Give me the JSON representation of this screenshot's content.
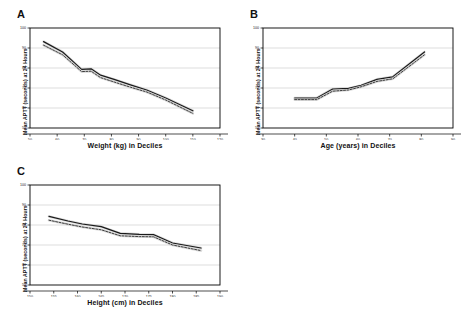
{
  "figure": {
    "background": "#ffffff",
    "axis_color": "#000000",
    "grid_color": "#b8b8b8",
    "solid_series_color": "#1a1a1a",
    "dashed_series_color": "#2b2b2b",
    "halo_color": "#cfcfcf"
  },
  "panels": [
    {
      "letter": "A",
      "ylabel": "Mean APTT (seconds) at 24 Hours",
      "xlabel": "Weight (kg) in Deciles"
    },
    {
      "letter": "B",
      "ylabel": "Mean APTT (seconds) at 24 Hours",
      "xlabel": "Age (years) in Deciles"
    },
    {
      "letter": "C",
      "ylabel": "Mean APTT (seconds) at 24 Hours",
      "xlabel": "Height (cm) in Deciles"
    }
  ],
  "chart_data": [
    {
      "type": "line",
      "panel": "A",
      "title": "",
      "xlabel": "Weight (kg) in Deciles",
      "ylabel": "Mean APTT (seconds) at 24 Hours",
      "xlim": [
        50,
        120
      ],
      "ylim": [
        50,
        100
      ],
      "xticks": [
        50,
        60,
        70,
        80,
        90,
        100,
        110,
        120
      ],
      "yticks": [
        50,
        60,
        70,
        80,
        90,
        100
      ],
      "grid": true,
      "legend": "none",
      "series": [
        {
          "name": "Observed mean APTT",
          "style": "solid",
          "x": [
            55,
            62,
            69,
            72.5,
            76,
            81,
            87,
            93,
            100,
            110
          ],
          "values": [
            93.2,
            88.0,
            79.3,
            79.6,
            76.4,
            74.3,
            71.6,
            69.0,
            65.0,
            58.6
          ]
        },
        {
          "name": "Predicted mean APTT",
          "style": "dashed",
          "x": [
            55,
            62,
            69,
            72.5,
            76,
            81,
            87,
            93,
            100,
            110
          ],
          "values": [
            91.4,
            86.6,
            78.2,
            78.4,
            75.2,
            73.0,
            70.4,
            68.0,
            64.0,
            57.3
          ]
        }
      ]
    },
    {
      "type": "line",
      "panel": "B",
      "title": "",
      "xlabel": "Age (years) in Deciles",
      "ylabel": "Mean APTT (seconds) at 24 Hours",
      "xlim": [
        30,
        90
      ],
      "ylim": [
        50,
        100
      ],
      "xticks": [
        30,
        40,
        50,
        60,
        70,
        80,
        90
      ],
      "yticks": [
        50,
        60,
        70,
        80,
        90,
        100
      ],
      "grid": true,
      "legend": "none",
      "series": [
        {
          "name": "Observed mean APTT",
          "style": "solid",
          "x": [
            40,
            47,
            52,
            57,
            61,
            66,
            71,
            81
          ],
          "values": [
            65.0,
            65.0,
            69.5,
            69.8,
            71.3,
            74.3,
            75.6,
            88.0
          ]
        },
        {
          "name": "Predicted mean APTT",
          "style": "dashed",
          "x": [
            40,
            47,
            52,
            57,
            61,
            66,
            71,
            81
          ],
          "values": [
            64.2,
            64.2,
            68.4,
            69.0,
            70.6,
            73.3,
            74.6,
            86.6
          ]
        }
      ]
    },
    {
      "type": "line",
      "panel": "C",
      "title": "",
      "xlabel": "Height (cm) in Deciles",
      "ylabel": "Mean APTT (seconds) at 24 Hours",
      "xlim": [
        150,
        190
      ],
      "ylim": [
        50,
        100
      ],
      "xticks": [
        150,
        155,
        160,
        165,
        170,
        175,
        180,
        185,
        190
      ],
      "yticks": [
        50,
        60,
        70,
        80,
        90,
        100
      ],
      "grid": true,
      "legend": "none",
      "series": [
        {
          "name": "Observed mean APTT",
          "style": "solid",
          "x": [
            154,
            158,
            161,
            165,
            169,
            173,
            176,
            180,
            186
          ],
          "values": [
            84.3,
            82.0,
            80.5,
            79.2,
            75.8,
            75.3,
            75.2,
            71.0,
            68.5
          ]
        },
        {
          "name": "Predicted mean APTT",
          "style": "dashed",
          "x": [
            154,
            158,
            161,
            165,
            169,
            173,
            176,
            180,
            186
          ],
          "values": [
            82.4,
            80.4,
            79.0,
            77.6,
            74.6,
            74.2,
            74.1,
            70.0,
            67.2
          ]
        }
      ]
    }
  ]
}
